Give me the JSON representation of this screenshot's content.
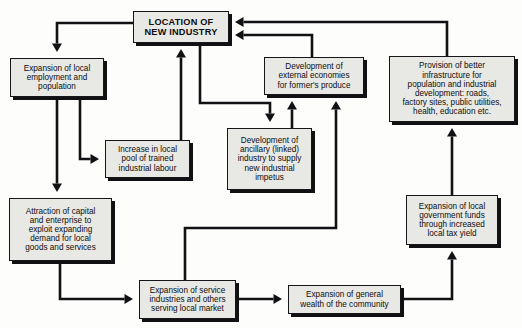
{
  "diagram": {
    "type": "flowchart",
    "background_color": "#fdfdfc",
    "node_fill_color": "#e8e8e4",
    "node_border_color": "#16161a",
    "shadow_color": "#111114",
    "arrow_color": "#111114"
  },
  "nodes": [
    {
      "id": "location",
      "name": "location-of-new-industry",
      "label": "LOCATION OF\nNEW INDUSTRY",
      "emphasis": "bold",
      "x": 133,
      "y": 11,
      "w": 96,
      "h": 32,
      "font_size": 9.2
    },
    {
      "id": "employment",
      "name": "expansion-of-local-employment",
      "label": "Expansion of local\nemployment and\npopulation",
      "emphasis": "normal",
      "x": 10,
      "y": 58,
      "w": 94,
      "h": 39,
      "font_size": 8.2
    },
    {
      "id": "labour",
      "name": "increase-in-local-pool-of-trained-labour",
      "label": "Increase in local\npool of trained\nindustrial labour",
      "emphasis": "normal",
      "x": 105,
      "y": 140,
      "w": 85,
      "h": 38,
      "font_size": 8.2
    },
    {
      "id": "capital",
      "name": "attraction-of-capital-and-enterprise",
      "label": "Attraction of capital\nand enterprise to\nexploit expanding\ndemand for local\ngoods and services",
      "emphasis": "normal",
      "x": 9,
      "y": 198,
      "w": 103,
      "h": 63,
      "font_size": 8.2
    },
    {
      "id": "ancillary",
      "name": "development-of-ancillary-industry",
      "label": "Development of\nancillary (linked)\nindustry to supply\nnew industrial\nimpetus",
      "emphasis": "normal",
      "x": 227,
      "y": 128,
      "w": 85,
      "h": 62,
      "font_size": 8.2
    },
    {
      "id": "external",
      "name": "development-of-external-economies",
      "label": "Development of\nexternal economies\nfor former's produce",
      "emphasis": "normal",
      "x": 264,
      "y": 57,
      "w": 100,
      "h": 38,
      "font_size": 8.2
    },
    {
      "id": "infrastructure",
      "name": "provision-of-better-infrastructure",
      "label": "Provision of better\ninfrastructure for\npopulation and industrial\ndevelopment: roads,\nfactory sites, public utilities,\nhealth, education etc.",
      "emphasis": "normal",
      "x": 389,
      "y": 56,
      "w": 126,
      "h": 66,
      "font_size": 8.2
    },
    {
      "id": "govfunds",
      "name": "expansion-of-local-government-funds",
      "label": "Expansion of local\ngovernment funds\nthrough increased\nlocal tax yield",
      "emphasis": "normal",
      "x": 406,
      "y": 195,
      "w": 92,
      "h": 50,
      "font_size": 8.2
    },
    {
      "id": "services",
      "name": "expansion-of-service-industries",
      "label": "Expansion of service\nindustries and others\nserving local market",
      "emphasis": "normal",
      "x": 139,
      "y": 280,
      "w": 97,
      "h": 39,
      "font_size": 8.2
    },
    {
      "id": "wealth",
      "name": "expansion-of-general-wealth",
      "label": "Expansion of general\nwealth of the community",
      "emphasis": "normal",
      "x": 288,
      "y": 285,
      "w": 113,
      "h": 29,
      "font_size": 8.2
    }
  ],
  "edges": [
    {
      "id": "e1",
      "name": "edge-location-to-employment",
      "from": "location",
      "to": "employment",
      "points": "133,23 57,23 57,52"
    },
    {
      "id": "e2",
      "name": "edge-employment-to-capital",
      "from": "employment",
      "to": "capital",
      "points": "57,100 57,192"
    },
    {
      "id": "e3",
      "name": "edge-employment-to-labour",
      "from": "employment",
      "to": "labour",
      "points": "80,100 80,159 99,159"
    },
    {
      "id": "e4",
      "name": "edge-labour-to-location",
      "from": "labour",
      "to": "location",
      "points": "181,140 181,49"
    },
    {
      "id": "e5",
      "name": "edge-location-to-ancillary",
      "from": "location",
      "to": "ancillary",
      "points": "200,43 200,103 270,103 270,122"
    },
    {
      "id": "e6",
      "name": "edge-ancillary-to-external",
      "from": "ancillary",
      "to": "external",
      "points": "292,128 292,101"
    },
    {
      "id": "e7",
      "name": "edge-capital-to-services",
      "from": "capital",
      "to": "services",
      "points": "60,261 60,299 133,299"
    },
    {
      "id": "e8",
      "name": "edge-services-to-wealth",
      "from": "services",
      "to": "wealth",
      "points": "239,299 282,299"
    },
    {
      "id": "e9",
      "name": "edge-services-to-external",
      "from": "services",
      "to": "external",
      "points": "185,280 185,228 336,228 336,101"
    },
    {
      "id": "e10",
      "name": "edge-wealth-to-govfunds",
      "from": "wealth",
      "to": "govfunds",
      "points": "401,299 452,299 452,251"
    },
    {
      "id": "e11",
      "name": "edge-govfunds-to-infrastructure",
      "from": "govfunds",
      "to": "infrastructure",
      "points": "452,195 452,128"
    },
    {
      "id": "e12",
      "name": "edge-infrastructure-to-location",
      "from": "infrastructure",
      "to": "location",
      "points": "447,56 447,22 235,22"
    },
    {
      "id": "e13",
      "name": "edge-external-to-location",
      "from": "external",
      "to": "location",
      "points": "312,57 312,35 235,35"
    }
  ]
}
